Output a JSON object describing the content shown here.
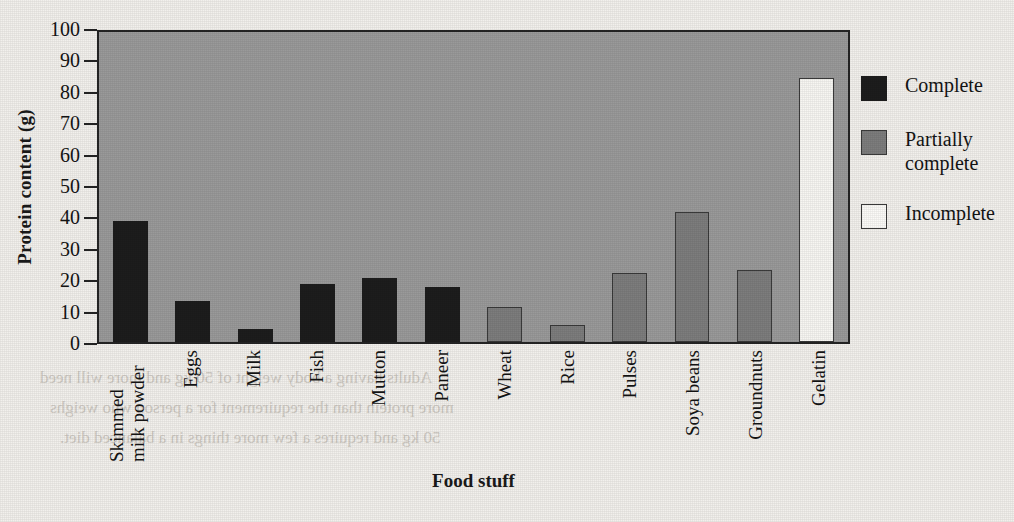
{
  "chart_data": {
    "type": "bar",
    "title": "",
    "xlabel": "Food stuff",
    "ylabel": "Protein content (g)",
    "ylim": [
      0,
      100
    ],
    "yticks": [
      100,
      90,
      80,
      70,
      60,
      50,
      40,
      30,
      20,
      10,
      0
    ],
    "grid": false,
    "legend_position": "right",
    "categories": [
      "Skimmed milk powder",
      "Eggs",
      "Milk",
      "Fish",
      "Mutton",
      "Paneer",
      "Wheat",
      "Rice",
      "Pulses",
      "Soya beans",
      "Groundnuts",
      "Gelatin"
    ],
    "values": [
      38.5,
      13,
      4,
      18.5,
      20.5,
      17.5,
      11,
      5.5,
      22,
      41.5,
      23,
      84
    ],
    "point_classes": [
      "complete",
      "complete",
      "complete",
      "complete",
      "complete",
      "complete",
      "partial",
      "partial",
      "partial",
      "partial",
      "partial",
      "incomplete"
    ],
    "series": [
      {
        "name": "Complete",
        "class": "complete",
        "color": "#1d1d1d",
        "points": [
          {
            "category": "Skimmed milk powder",
            "value": 38.5
          },
          {
            "category": "Eggs",
            "value": 13
          },
          {
            "category": "Milk",
            "value": 4
          },
          {
            "category": "Fish",
            "value": 18.5
          },
          {
            "category": "Mutton",
            "value": 20.5
          },
          {
            "category": "Paneer",
            "value": 17.5
          }
        ]
      },
      {
        "name": "Partially complete",
        "class": "partial",
        "color": "#7d7d7d",
        "points": [
          {
            "category": "Wheat",
            "value": 11
          },
          {
            "category": "Rice",
            "value": 5.5
          },
          {
            "category": "Pulses",
            "value": 22
          },
          {
            "category": "Soya beans",
            "value": 41.5
          },
          {
            "category": "Groundnuts",
            "value": 23
          }
        ]
      },
      {
        "name": "Incomplete",
        "class": "incomplete",
        "color": "#fbfaf7",
        "points": [
          {
            "category": "Gelatin",
            "value": 84
          }
        ]
      }
    ],
    "legend": [
      {
        "label": "Complete",
        "class": "complete",
        "color": "#1d1d1d"
      },
      {
        "label": "Partially complete",
        "class": "partial",
        "color": "#7d7d7d"
      },
      {
        "label": "Incomplete",
        "class": "incomplete",
        "color": "#fbfaf7"
      }
    ]
  },
  "colors": {
    "page_background": "#f2f0ec",
    "plot_background": "#9a9a9a",
    "axis": "#242424",
    "text": "#141414",
    "complete": "#1d1d1d",
    "partial": "#7d7d7d",
    "incomplete": "#fbfaf7"
  },
  "ghost_text": [
    "Adults having a body weight of 50 kg and more will need",
    "more protein than the requirement for a person who weighs",
    "50 kg and requires a few more things in a balanced diet."
  ]
}
